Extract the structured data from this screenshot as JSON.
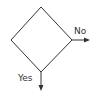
{
  "diagram": {
    "type": "flowchart-decision",
    "shape": "diamond",
    "branches": [
      {
        "label": "No",
        "direction": "right"
      },
      {
        "label": "Yes",
        "direction": "down"
      }
    ],
    "colors": {
      "stroke": "#333333",
      "background": "#ffffff"
    }
  }
}
